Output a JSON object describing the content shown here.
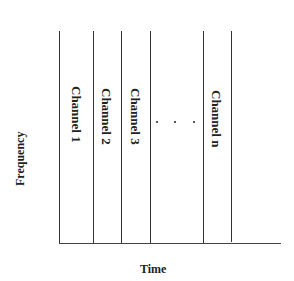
{
  "diagram": {
    "type": "channel-partition",
    "axis": {
      "x_label": "Time",
      "y_label": "Frequency"
    },
    "channels": [
      {
        "label": "Channel 1"
      },
      {
        "label": "Channel 2"
      },
      {
        "label": "Channel 3"
      },
      {
        "label": "Channel n"
      }
    ],
    "ellipsis": "· · ·",
    "colors": {
      "line": "#333333",
      "text": "#222222",
      "background": "#ffffff"
    }
  }
}
